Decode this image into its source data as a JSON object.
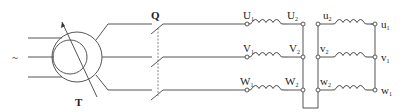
{
  "diagram": {
    "source_symbol": "~",
    "transformer": {
      "label": "T"
    },
    "switch": {
      "label": "Q"
    },
    "primary_terminals": [
      {
        "name": "U",
        "sub": "1"
      },
      {
        "name": "V",
        "sub": "1"
      },
      {
        "name": "W",
        "sub": "1"
      }
    ],
    "primary_end_terminals": [
      {
        "name": "U",
        "sub": "2"
      },
      {
        "name": "V",
        "sub": "2"
      },
      {
        "name": "W",
        "sub": "2"
      }
    ],
    "secondary_start_terminals": [
      {
        "name": "u",
        "sub": "2"
      },
      {
        "name": "v",
        "sub": "2"
      },
      {
        "name": "w",
        "sub": "2"
      }
    ],
    "secondary_end_terminals": [
      {
        "name": "u",
        "sub": "1"
      },
      {
        "name": "v",
        "sub": "1"
      },
      {
        "name": "w",
        "sub": "1"
      }
    ],
    "colors": {
      "line": "#555555",
      "background": "#ffffff"
    }
  }
}
